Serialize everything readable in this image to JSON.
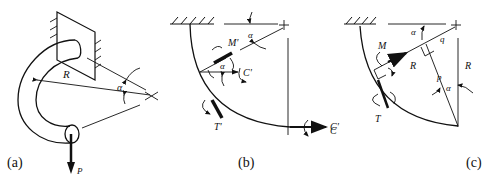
{
  "figure": {
    "panels": [
      {
        "id": "a",
        "caption": "(a)",
        "labels": {
          "radius": "R",
          "angle": "α",
          "load": "P"
        }
      },
      {
        "id": "b",
        "caption": "(b)",
        "labels": {
          "moment": "M'",
          "angle_top": "α",
          "angle_inner": "α",
          "couple": "C'",
          "torque": "T'",
          "couple_end": "C'"
        }
      },
      {
        "id": "c",
        "caption": "(c)",
        "labels": {
          "moment": "M",
          "torque": "T",
          "radius_along": "R",
          "q": "q",
          "p": "p",
          "angle_top": "α",
          "angle_mid": "α",
          "radius_vertical": "R",
          "couple_left": "C"
        }
      }
    ],
    "stroke_color": "#111111",
    "background": "#ffffff"
  }
}
